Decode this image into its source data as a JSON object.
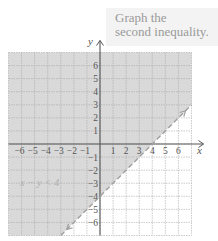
{
  "caption": {
    "line1": "Graph the",
    "line2": "second inequality."
  },
  "axes": {
    "x_label": "x",
    "y_label": "y"
  },
  "inequality_label": "x − y < 4",
  "colors": {
    "shade": "#d9d9d9",
    "grid": "#a8a8a8",
    "axis": "#555555",
    "boundary": "#a0a0a0"
  },
  "chart_data": {
    "type": "line",
    "title": "Graph the second inequality.",
    "xlabel": "x",
    "ylabel": "y",
    "xlim": [
      -7,
      7
    ],
    "ylim": [
      -7,
      7
    ],
    "grid": true,
    "x_ticks": [
      -6,
      -5,
      -4,
      -3,
      -2,
      -1,
      1,
      2,
      3,
      4,
      5,
      6
    ],
    "y_ticks": [
      -6,
      -5,
      -4,
      -3,
      -2,
      -1,
      1,
      2,
      3,
      4,
      5,
      6
    ],
    "series": [
      {
        "name": "x − y = 4 (boundary, dashed)",
        "style": "dashed",
        "x": [
          -3,
          7
        ],
        "y": [
          -7,
          3
        ]
      }
    ],
    "shaded_region": "x − y < 4 (above/left of boundary line)",
    "annotations": [
      "x − y < 4"
    ],
    "key_points": [
      {
        "x": 0,
        "y": -4,
        "label": "y-intercept"
      },
      {
        "x": 4,
        "y": 0,
        "label": "x-intercept"
      }
    ]
  }
}
